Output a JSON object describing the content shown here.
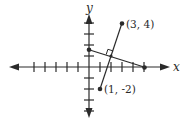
{
  "diagram": {
    "type": "coordinate-plane",
    "axes": {
      "x_label": "x",
      "y_label": "y",
      "x_ticks": [
        -5,
        -4,
        -3,
        -2,
        -1,
        1,
        2,
        3,
        4,
        5
      ],
      "y_ticks": [
        -4,
        -3,
        -2,
        -1,
        1,
        2,
        3,
        4
      ],
      "x_range": [
        -7,
        7
      ],
      "y_range": [
        -4.6,
        4.8
      ]
    },
    "points": [
      {
        "label": "(3, 4)",
        "x": 3,
        "y": 4
      },
      {
        "label": "(1, -2)",
        "x": 1,
        "y": -2
      }
    ],
    "segment": {
      "from": [
        1,
        -2
      ],
      "to": [
        3,
        4
      ]
    },
    "perpendicular_bisector": {
      "from": [
        0,
        1.67
      ],
      "to": [
        5,
        0
      ],
      "midpoint": [
        2,
        1
      ],
      "right_angle_marker": true
    },
    "colors": {
      "ink": "#2a2a2a",
      "background": "#ffffff"
    }
  }
}
